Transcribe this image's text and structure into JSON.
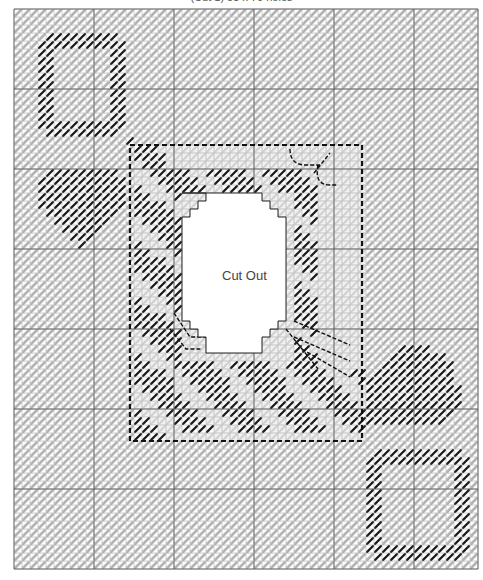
{
  "caption": "(Cut 1) 53 x 70 holes",
  "chart_data": {
    "type": "stitch-chart",
    "grid": {
      "origin_x": 14,
      "origin_y": 9,
      "cell": 8,
      "cols": 58,
      "rows": 70,
      "major_every": 10
    },
    "colors": {
      "background_stitch": "#b8b8b8",
      "dark_stitch": "#1a1a1a",
      "grid_minor": "#9a9a9a",
      "grid_major": "#555555",
      "cutout": "#ffffff",
      "light_fill": "#e6e6e6"
    },
    "cutout": {
      "label": "Cut Out",
      "outline": [
        [
          21,
          23
        ],
        [
          31,
          23
        ],
        [
          31,
          24
        ],
        [
          32,
          24
        ],
        [
          32,
          25
        ],
        [
          33,
          25
        ],
        [
          33,
          26
        ],
        [
          34,
          26
        ],
        [
          34,
          39
        ],
        [
          33,
          39
        ],
        [
          33,
          40
        ],
        [
          32,
          40
        ],
        [
          32,
          41
        ],
        [
          31,
          41
        ],
        [
          31,
          43
        ],
        [
          24,
          43
        ],
        [
          24,
          41
        ],
        [
          23,
          41
        ],
        [
          23,
          40
        ],
        [
          22,
          40
        ],
        [
          22,
          39
        ],
        [
          21,
          39
        ],
        [
          21,
          26
        ],
        [
          22,
          26
        ],
        [
          22,
          25
        ],
        [
          23,
          25
        ],
        [
          23,
          24
        ],
        [
          24,
          24
        ],
        [
          24,
          23
        ]
      ]
    },
    "frame": {
      "x0": 14.5,
      "y0": 17,
      "x1": 43.5,
      "y1": 54
    }
  }
}
